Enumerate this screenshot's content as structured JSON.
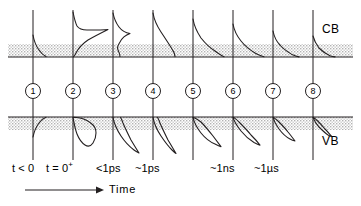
{
  "figure": {
    "title_alt": "Carrier distribution relaxation in conduction and valence bands versus time",
    "background_color": "#ffffff",
    "line_color": "#231f20",
    "band_fill_color": "#d9d9d9",
    "width": 361,
    "height": 206
  },
  "bands": {
    "conduction": {
      "label": "CB",
      "label_x": 322,
      "label_y": 29,
      "top_y": 44,
      "bottom_y": 57,
      "baseline_y": 57
    },
    "valence": {
      "label": "VB",
      "label_x": 322,
      "label_y": 141,
      "top_y": 117,
      "bottom_y": 130,
      "baseline_y": 117
    }
  },
  "axis": {
    "time_label": "Time",
    "arrow_x_start": 25,
    "arrow_x_end": 100,
    "arrow_y": 190,
    "label_x": 108,
    "label_y": 185
  },
  "stages": [
    {
      "id": 1,
      "number": "1",
      "axis_x": 33,
      "circle_cx": 33,
      "circle_cy": 91,
      "time_label": "t < 0",
      "time_label_x": 12,
      "time_label_y": 167,
      "cb_peak_height": 22,
      "vb_peak_height": 20,
      "description": "equilibrium carriers before excitation"
    },
    {
      "id": 2,
      "number": "2",
      "axis_x": 73,
      "circle_cx": 73,
      "circle_cy": 91,
      "time_label": "t = 0",
      "time_label_sup": "+",
      "time_label_x": 45,
      "time_label_y": 167,
      "cb_peak_height": 48,
      "vb_peak_height": 45,
      "description": "photoexcited non-thermal distribution"
    },
    {
      "id": 3,
      "number": "3",
      "axis_x": 113,
      "circle_cx": 113,
      "circle_cy": 91,
      "time_label": "<1ps",
      "time_label_x": 95,
      "time_label_y": 167,
      "cb_peak_height": 44,
      "vb_peak_height": 40,
      "description": "carrier-carrier scattering begins thermalization"
    },
    {
      "id": 4,
      "number": "4",
      "axis_x": 153,
      "circle_cx": 153,
      "circle_cy": 91,
      "time_label": "~1ps",
      "time_label_x": 135,
      "time_label_y": 167,
      "cb_peak_height": 44,
      "vb_peak_height": 40,
      "description": "hot thermalized carrier distribution"
    },
    {
      "id": 5,
      "number": "5",
      "axis_x": 193,
      "circle_cx": 193,
      "circle_cy": 91,
      "time_label": "",
      "time_label_x": 175,
      "time_label_y": 167,
      "cb_peak_height": 38,
      "vb_peak_height": 34,
      "description": "carrier cooling by phonon emission"
    },
    {
      "id": 6,
      "number": "6",
      "axis_x": 233,
      "circle_cx": 233,
      "circle_cy": 91,
      "time_label": "~1ns",
      "time_label_x": 210,
      "time_label_y": 167,
      "cb_peak_height": 33,
      "vb_peak_height": 30,
      "description": "cooled carriers near band edge"
    },
    {
      "id": 7,
      "number": "7",
      "axis_x": 273,
      "circle_cx": 273,
      "circle_cy": 91,
      "time_label": "~1µs",
      "time_label_x": 255,
      "time_label_y": 167,
      "cb_peak_height": 26,
      "vb_peak_height": 24,
      "description": "recombination reduces carrier density"
    },
    {
      "id": 8,
      "number": "8",
      "axis_x": 313,
      "circle_cx": 313,
      "circle_cy": 91,
      "time_label": "",
      "time_label_x": 295,
      "time_label_y": 167,
      "cb_peak_height": 21,
      "vb_peak_height": 19,
      "description": "return to equilibrium"
    }
  ]
}
